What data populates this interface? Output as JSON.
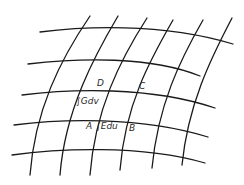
{
  "diagram": {
    "type": "curvilinear-coordinate-grid",
    "colors": {
      "line": "#1a1a1a",
      "text": "#2a2a2a",
      "background": "#ffffff"
    },
    "points": {
      "A": "A",
      "B": "B",
      "C": "C",
      "D": "D"
    },
    "integrals": {
      "left_side": "∫Gdv",
      "bottom_side": "∫Edu"
    },
    "u_curves": [
      "M40,32 C80,27 160,22 233,44",
      "M28,64 C80,58 150,56 200,76",
      "M22,95 C70,89 150,86 215,108",
      "M14,125 C60,119 140,116 208,137",
      "M12,155 C55,149 140,144 205,163"
    ],
    "v_curves": [
      "M90,16 C60,60 35,110 30,175",
      "M118,16 C95,55 65,110 60,175",
      "M147,18 C120,60 95,110 90,175",
      "M173,20 C150,60 125,105 120,170",
      "M203,20 C180,60 158,105 152,168",
      "M232,18 C210,60 188,105 182,165"
    ]
  }
}
